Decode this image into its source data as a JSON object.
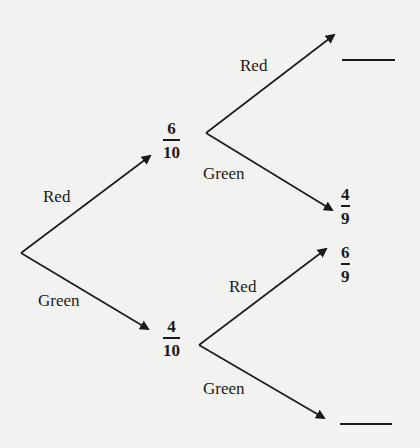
{
  "diagram": {
    "type": "probability-tree",
    "line_color": "#1a1a1a",
    "background": "#f2f2f0",
    "first_draw": {
      "red": {
        "label": "Red",
        "probability": {
          "numerator": "6",
          "denominator": "10"
        }
      },
      "green": {
        "label": "Green",
        "probability": {
          "numerator": "4",
          "denominator": "10"
        }
      }
    },
    "second_draw_after_red": {
      "red": {
        "label": "Red",
        "probability": "blank"
      },
      "green": {
        "label": "Green",
        "probability": {
          "numerator": "4",
          "denominator": "9"
        }
      }
    },
    "second_draw_after_green": {
      "red": {
        "label": "Red",
        "probability": {
          "numerator": "6",
          "denominator": "9"
        }
      },
      "green": {
        "label": "Green",
        "probability": "blank"
      }
    }
  }
}
